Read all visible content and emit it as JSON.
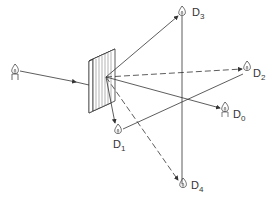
{
  "diagram": {
    "title": "",
    "source": {
      "name": "candle-source",
      "x": 15,
      "y": 70
    },
    "grating": {
      "name": "diffraction-grating",
      "center": [
        106,
        77
      ]
    },
    "detectors": [
      {
        "id": "D3",
        "letter": "D",
        "sub": "3",
        "x": 182,
        "y": 12
      },
      {
        "id": "D2",
        "letter": "D",
        "sub": "2",
        "x": 247,
        "y": 68
      },
      {
        "id": "D0",
        "letter": "D",
        "sub": "0",
        "x": 225,
        "y": 111
      },
      {
        "id": "D1",
        "letter": "D",
        "sub": "1",
        "x": 118,
        "y": 130
      },
      {
        "id": "D4",
        "letter": "D",
        "sub": "4",
        "x": 183,
        "y": 184
      }
    ],
    "colors": {
      "line": "#333333",
      "fill": "#ffffff"
    }
  }
}
